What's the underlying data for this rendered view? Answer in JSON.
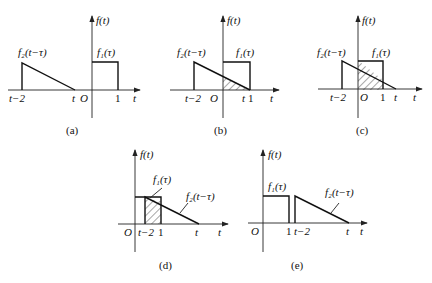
{
  "figure": {
    "panels": [
      {
        "id": "a",
        "caption": "(a)",
        "axis_label_y": "f(t)",
        "axis_label_x": "t",
        "f1_label": "f₁(τ)",
        "f2_label": "f₂(t−τ)",
        "ticks": [
          "t−2",
          "t",
          "O",
          "1"
        ],
        "hatched": false
      },
      {
        "id": "b",
        "caption": "(b)",
        "axis_label_y": "f(t)",
        "axis_label_x": "t",
        "f1_label": "f₁(τ)",
        "f2_label": "f₂(t−τ)",
        "ticks": [
          "t−2",
          "O",
          "t",
          "1"
        ],
        "hatched": true
      },
      {
        "id": "c",
        "caption": "(c)",
        "axis_label_y": "f(t)",
        "axis_label_x": "t",
        "f1_label": "f₁(τ)",
        "f2_label": "f₂(t−τ)",
        "ticks": [
          "t−2",
          "O",
          "1",
          "t"
        ],
        "hatched": true
      },
      {
        "id": "d",
        "caption": "(d)",
        "axis_label_y": "f(t)",
        "axis_label_x": "t",
        "f1_label": "f₁(τ)",
        "f2_label": "f₂(t−τ)",
        "ticks": [
          "O",
          "t−2",
          "1",
          "t"
        ],
        "hatched": true
      },
      {
        "id": "e",
        "caption": "(e)",
        "axis_label_y": "f(t)",
        "axis_label_x": "t",
        "f1_label": "f₁(τ)",
        "f2_label": "f₂(t−τ)",
        "ticks": [
          "O",
          "1",
          "t−2",
          "t"
        ],
        "hatched": false
      }
    ]
  }
}
